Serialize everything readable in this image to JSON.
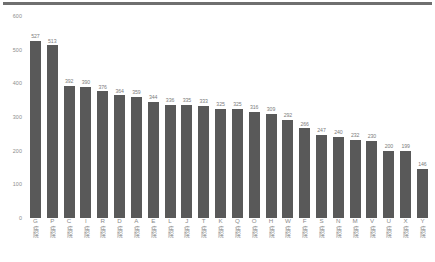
{
  "chart_data": {
    "type": "bar",
    "title": "",
    "subtitle": "",
    "xlabel": "",
    "ylabel": "",
    "ylim": [
      0,
      600
    ],
    "yticks": [
      0,
      100,
      200,
      300,
      400,
      500,
      600
    ],
    "grid": false,
    "legend": null,
    "bar_color": "#595959",
    "label_color": "#8a8a8a",
    "label_suffix": "病院",
    "categories": [
      "G病院",
      "P病院",
      "C病院",
      "I病院",
      "R病院",
      "D病院",
      "A病院",
      "E病院",
      "L病院",
      "J病院",
      "T病院",
      "K病院",
      "Q病院",
      "O病院",
      "H病院",
      "W病院",
      "F病院",
      "S病院",
      "N病院",
      "M病院",
      "V病院",
      "U病院",
      "X病院",
      "Y病院"
    ],
    "category_letters": [
      "G",
      "P",
      "C",
      "I",
      "R",
      "D",
      "A",
      "E",
      "L",
      "J",
      "T",
      "K",
      "Q",
      "O",
      "H",
      "W",
      "F",
      "S",
      "N",
      "M",
      "V",
      "U",
      "X",
      "Y"
    ],
    "values": [
      527,
      513,
      392,
      390,
      376,
      364,
      359,
      344,
      336,
      335,
      333,
      325,
      325,
      316,
      309,
      292,
      266,
      247,
      240,
      232,
      230,
      200,
      199,
      146
    ]
  }
}
